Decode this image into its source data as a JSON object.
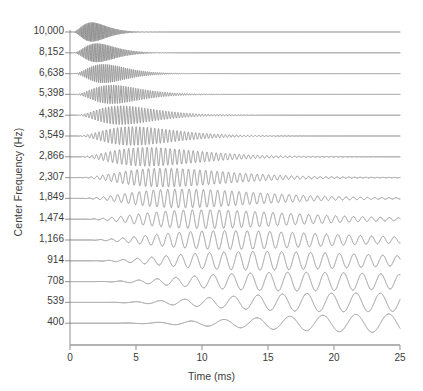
{
  "chart_data": {
    "type": "line",
    "title": "",
    "subtitle": "",
    "xlabel": "Time (ms)",
    "ylabel": "Center Frequency (Hz)",
    "xlim": [
      0,
      25
    ],
    "xticks": [
      0,
      5,
      10,
      15,
      20,
      25
    ],
    "xticklabels": [
      "0",
      "5",
      "10",
      "15",
      "20",
      "25"
    ],
    "grid": false,
    "legend": null,
    "categories": [
      "10,000",
      "8,152",
      "6,638",
      "5,398",
      "4,382",
      "3,549",
      "2,866",
      "2,307",
      "1,849",
      "1,474",
      "1,166",
      "914",
      "708",
      "539",
      "400"
    ],
    "series": [
      {
        "name": "10,000",
        "center_frequency_hz": 10000,
        "onset_ms": 0.1,
        "decay_ms": 0.52,
        "amplitude": 0.92
      },
      {
        "name": "8,152",
        "center_frequency_hz": 8152,
        "onset_ms": 0.12,
        "decay_ms": 0.64,
        "amplitude": 0.9
      },
      {
        "name": "6,638",
        "center_frequency_hz": 6638,
        "onset_ms": 0.14,
        "decay_ms": 0.8,
        "amplitude": 0.9
      },
      {
        "name": "5,398",
        "center_frequency_hz": 5398,
        "onset_ms": 0.16,
        "decay_ms": 1.0,
        "amplitude": 0.9
      },
      {
        "name": "4,382",
        "center_frequency_hz": 4382,
        "onset_ms": 0.19,
        "decay_ms": 1.22,
        "amplitude": 0.9
      },
      {
        "name": "3,549",
        "center_frequency_hz": 3549,
        "onset_ms": 0.22,
        "decay_ms": 1.5,
        "amplitude": 0.9
      },
      {
        "name": "2,866",
        "center_frequency_hz": 2866,
        "onset_ms": 0.26,
        "decay_ms": 1.85,
        "amplitude": 0.9
      },
      {
        "name": "2,307",
        "center_frequency_hz": 2307,
        "onset_ms": 0.31,
        "decay_ms": 2.25,
        "amplitude": 0.9
      },
      {
        "name": "1,849",
        "center_frequency_hz": 1849,
        "onset_ms": 0.37,
        "decay_ms": 2.7,
        "amplitude": 0.9
      },
      {
        "name": "1,474",
        "center_frequency_hz": 1474,
        "onset_ms": 0.45,
        "decay_ms": 3.2,
        "amplitude": 0.9
      },
      {
        "name": "1,166",
        "center_frequency_hz": 1166,
        "onset_ms": 0.56,
        "decay_ms": 3.8,
        "amplitude": 0.9
      },
      {
        "name": "914",
        "center_frequency_hz": 914,
        "onset_ms": 0.72,
        "decay_ms": 4.5,
        "amplitude": 0.9
      },
      {
        "name": "708",
        "center_frequency_hz": 708,
        "onset_ms": 0.95,
        "decay_ms": 5.4,
        "amplitude": 0.9
      },
      {
        "name": "539",
        "center_frequency_hz": 539,
        "onset_ms": 1.25,
        "decay_ms": 6.6,
        "amplitude": 0.9
      },
      {
        "name": "400",
        "center_frequency_hz": 400,
        "onset_ms": 1.65,
        "decay_ms": 8.2,
        "amplitude": 0.9
      }
    ],
    "style": {
      "trace_color": "#8a8a8a",
      "axis_color": "#9a9a9a",
      "text_color": "#3b3b3b",
      "background": "#ffffff",
      "trace_width": 0.9
    },
    "geometry": {
      "plot_left": 70,
      "plot_right": 400,
      "plot_top": 30,
      "baseline_top": 32,
      "baseline_step": 20.8,
      "axis_y": 345
    }
  }
}
